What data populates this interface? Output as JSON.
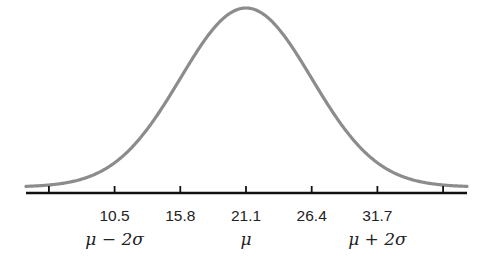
{
  "chart_data": {
    "type": "line",
    "title": "",
    "mean": 21.1,
    "std": 5.3,
    "x_ticks": [
      5.2,
      10.5,
      15.8,
      21.1,
      26.4,
      31.7,
      37.0
    ],
    "tick_labels": [
      "",
      "10.5",
      "15.8",
      "21.1",
      "26.4",
      "31.7",
      ""
    ],
    "symbolic_labels": [
      {
        "at": 10.5,
        "label": "μ − 2σ"
      },
      {
        "at": 21.1,
        "label": "μ"
      },
      {
        "at": 31.7,
        "label": "μ + 2σ"
      }
    ],
    "xlabel": "",
    "ylabel": "",
    "xlim": [
      2.2,
      40.6
    ],
    "grid": false,
    "legend": null,
    "colors": {
      "curve": "#8c8c8c",
      "axis": "#111111"
    }
  }
}
